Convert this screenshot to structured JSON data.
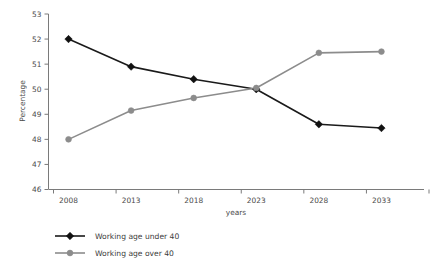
{
  "chart_data": {
    "type": "line",
    "title": "",
    "xlabel": "years",
    "ylabel": "Percentage",
    "categories": [
      "2008",
      "2013",
      "2018",
      "2023",
      "2028",
      "2033"
    ],
    "x": [
      2008,
      2013,
      2018,
      2023,
      2028,
      2033
    ],
    "ylim": [
      46,
      53
    ],
    "yticks": [
      46,
      47,
      48,
      49,
      50,
      51,
      52,
      53
    ],
    "ytick_labels": [
      "46",
      "47",
      "48",
      "49",
      "50",
      "51",
      "52",
      "53"
    ],
    "grid": false,
    "legend_position": "below-left",
    "series": [
      {
        "name": "Working age under 40",
        "color": "#1a1a1a",
        "marker": "diamond",
        "values": [
          52.0,
          50.9,
          50.4,
          50.0,
          48.6,
          48.45
        ]
      },
      {
        "name": "Working age over 40",
        "color": "#8c8c8c",
        "marker": "circle",
        "values": [
          48.0,
          49.15,
          49.65,
          50.05,
          51.45,
          51.5
        ]
      }
    ]
  },
  "legend": {
    "items": [
      {
        "label": "Working age under 40",
        "marker": "diamond-marker-icon"
      },
      {
        "label": "Working age over 40",
        "marker": "circle-marker-icon"
      }
    ]
  },
  "axes": {
    "y_title": "Percentage",
    "x_title": "years"
  }
}
